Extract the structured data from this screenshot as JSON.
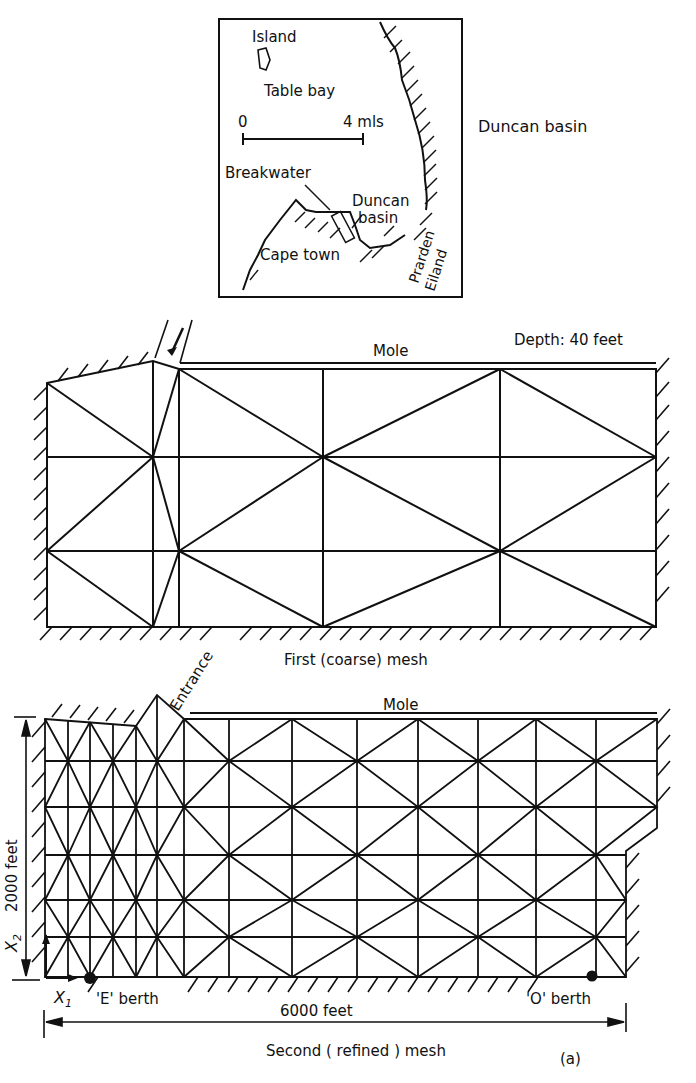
{
  "inset_map": {
    "labels": {
      "island": "Island",
      "table_bay": "Table bay",
      "scale_zero": "0",
      "scale_end": "4 mls",
      "breakwater": "Breakwater",
      "duncan_basin_1": "Duncan",
      "duncan_basin_2": "basin",
      "cape_town": "Cape town",
      "prarden": "Prarden",
      "eiland": "Eiland"
    },
    "side_label": "Duncan basin"
  },
  "coarse_mesh": {
    "depth_label": "Depth:  40 feet",
    "mole_label": "Mole",
    "caption": "First  (coarse) mesh",
    "entrance_label": "Entrance"
  },
  "refined_mesh": {
    "mole_label": "Mole",
    "height_dim": "2000 feet",
    "x2_label": "X",
    "x2_sub": "2",
    "x1_label": "X",
    "x1_sub": "1",
    "e_berth": "'E' berth",
    "o_berth": "'O' berth",
    "width_dim": "6000 feet",
    "caption": "Second  ( refined )  mesh",
    "figure_tag": "(a)"
  },
  "colors": {
    "ink": "#111111",
    "paper": "#ffffff"
  }
}
